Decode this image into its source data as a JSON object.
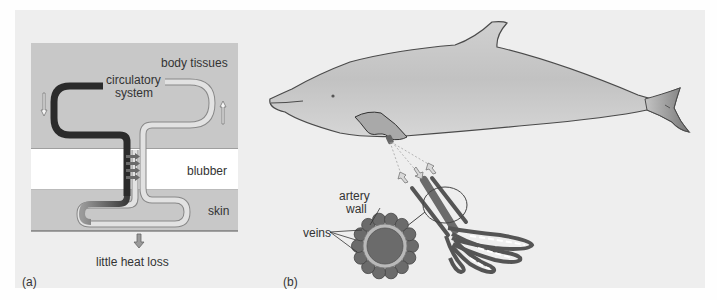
{
  "figure": {
    "panel_a": {
      "tag": "(a)",
      "labels": {
        "body_tissues": "body tissues",
        "circulatory_line1": "circulatory",
        "circulatory_line2": "system",
        "blubber": "blubber",
        "skin": "skin",
        "heat_loss": "little heat loss"
      },
      "colors": {
        "tissue_layer": "#c8c8c8",
        "blubber_layer": "#ffffff",
        "artery_dark": "#2b2b2b",
        "vein_light": "#d8d8d8",
        "heat_arrow": "#6a6a6a"
      }
    },
    "panel_b": {
      "tag": "(b)",
      "labels": {
        "artery_line1": "artery",
        "artery_line2": "wall",
        "veins": "veins"
      },
      "colors": {
        "dolphin_body": "#bfbfbf",
        "vessel": "#6b6b6b",
        "artery_wall": "#b9b9b9"
      }
    }
  }
}
